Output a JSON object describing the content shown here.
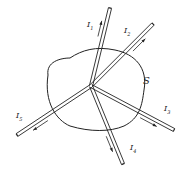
{
  "diagram": {
    "surface_label": "S",
    "junction": {
      "x": 91,
      "y": 86
    },
    "wires": [
      {
        "id": "I1",
        "label": "I",
        "sub": "1",
        "end": {
          "x": 110,
          "y": 8
        },
        "direction": "out",
        "label_pos": {
          "x": 87,
          "y": 21
        }
      },
      {
        "id": "I2",
        "label": "I",
        "sub": "2",
        "end": {
          "x": 153,
          "y": 24
        },
        "direction": "out",
        "label_pos": {
          "x": 124,
          "y": 27
        }
      },
      {
        "id": "I3",
        "label": "I",
        "sub": "3",
        "end": {
          "x": 174,
          "y": 130
        },
        "direction": "out",
        "label_pos": {
          "x": 164,
          "y": 105
        }
      },
      {
        "id": "I4",
        "label": "I",
        "sub": "4",
        "end": {
          "x": 123,
          "y": 164
        },
        "direction": "out",
        "label_pos": {
          "x": 130,
          "y": 144
        }
      },
      {
        "id": "I5",
        "label": "I",
        "sub": "5",
        "end": {
          "x": 17,
          "y": 135
        },
        "direction": "out",
        "label_pos": {
          "x": 16,
          "y": 112
        }
      }
    ],
    "colors": {
      "line": "#222222",
      "background": "#ffffff"
    }
  }
}
